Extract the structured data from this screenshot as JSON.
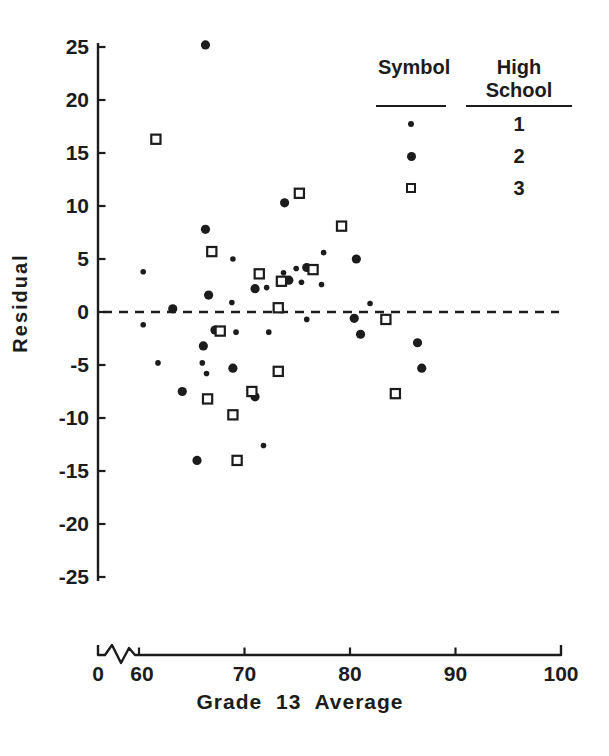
{
  "figure": {
    "background": "#ffffff",
    "ink_color": "#1c1c1c"
  },
  "chart_data": {
    "type": "scatter",
    "title": "",
    "xlabel": "Grade 13 Average",
    "ylabel": "Residual",
    "x_axis": {
      "tick_values": [
        0,
        60,
        70,
        80,
        90,
        100
      ],
      "axis_break_between": [
        0,
        60
      ],
      "data_range_shown": [
        60,
        100
      ],
      "grid": false
    },
    "y_axis": {
      "tick_values": [
        25,
        20,
        15,
        10,
        5,
        0,
        -5,
        -10,
        -15,
        -20,
        -25
      ],
      "range": [
        -25,
        25
      ],
      "grid": false
    },
    "zero_reference_line": {
      "y": 0,
      "style": "dashed"
    },
    "legend": {
      "position": "top-right",
      "col1_header": "Symbol",
      "col2_header": "High School",
      "rows": [
        {
          "marker": "small-dot",
          "label": "1"
        },
        {
          "marker": "medium-dot",
          "label": "2"
        },
        {
          "marker": "open-square",
          "label": "3"
        }
      ]
    },
    "series": [
      {
        "name": "High School 1",
        "marker": "small-dot",
        "points": [
          [
            60.4,
            3.8
          ],
          [
            60.4,
            -1.2
          ],
          [
            61.8,
            -4.8
          ],
          [
            66.0,
            -4.8
          ],
          [
            66.4,
            -5.8
          ],
          [
            68.8,
            0.9
          ],
          [
            68.9,
            5.0
          ],
          [
            69.2,
            -1.9
          ],
          [
            71.8,
            -12.6
          ],
          [
            72.1,
            2.3
          ],
          [
            72.3,
            -1.9
          ],
          [
            73.7,
            3.7
          ],
          [
            74.9,
            4.1
          ],
          [
            75.4,
            2.8
          ],
          [
            75.9,
            -0.7
          ],
          [
            77.3,
            2.6
          ],
          [
            77.5,
            5.6
          ],
          [
            81.9,
            0.8
          ]
        ]
      },
      {
        "name": "High School 2",
        "marker": "medium-dot",
        "points": [
          [
            63.2,
            0.3
          ],
          [
            64.1,
            -7.5
          ],
          [
            65.5,
            -14.0
          ],
          [
            66.1,
            -3.2
          ],
          [
            66.3,
            25.2
          ],
          [
            66.3,
            7.8
          ],
          [
            66.6,
            1.6
          ],
          [
            67.2,
            -1.7
          ],
          [
            68.9,
            -5.3
          ],
          [
            71.0,
            2.2
          ],
          [
            71.0,
            -8.0
          ],
          [
            73.8,
            10.3
          ],
          [
            74.2,
            3.0
          ],
          [
            75.9,
            4.2
          ],
          [
            80.4,
            -0.6
          ],
          [
            80.6,
            5.0
          ],
          [
            81.0,
            -2.1
          ],
          [
            86.4,
            -2.9
          ],
          [
            86.8,
            -5.3
          ]
        ]
      },
      {
        "name": "High School 3",
        "marker": "open-square",
        "points": [
          [
            61.6,
            16.3
          ],
          [
            66.5,
            -8.2
          ],
          [
            66.9,
            5.7
          ],
          [
            67.7,
            -1.8
          ],
          [
            68.9,
            -9.7
          ],
          [
            69.3,
            -14.0
          ],
          [
            70.7,
            -7.5
          ],
          [
            71.4,
            3.6
          ],
          [
            73.2,
            0.4
          ],
          [
            73.2,
            -5.6
          ],
          [
            73.5,
            2.9
          ],
          [
            75.2,
            11.2
          ],
          [
            76.5,
            4.0
          ],
          [
            79.2,
            8.1
          ],
          [
            83.4,
            -0.7
          ],
          [
            84.3,
            -7.7
          ]
        ]
      }
    ]
  }
}
